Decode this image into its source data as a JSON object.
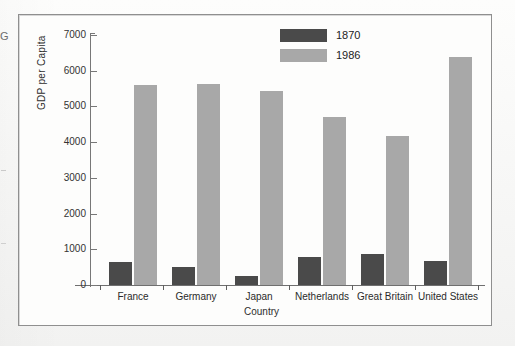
{
  "margin": {
    "stray_glyph": "G"
  },
  "chart_data": {
    "type": "bar",
    "title": "",
    "xlabel": "Country",
    "ylabel": "GDP per Capita",
    "ylim": [
      0,
      7000
    ],
    "ytick_step": 1000,
    "yticks": [
      "7000",
      "6000",
      "5000",
      "4000",
      "3000",
      "2000",
      "1000",
      "0"
    ],
    "grid": false,
    "legend_position": "top-center-right",
    "categories": [
      "France",
      "Germany",
      "Japan",
      "Netherlands",
      "Great Britain",
      "United States"
    ],
    "series": [
      {
        "name": "1870",
        "color": "#4a4a4a",
        "values": [
          640,
          500,
          250,
          780,
          870,
          670
        ]
      },
      {
        "name": "1986",
        "color": "#a8a8a8",
        "values": [
          5600,
          5620,
          5430,
          4700,
          4180,
          6380
        ]
      }
    ]
  }
}
